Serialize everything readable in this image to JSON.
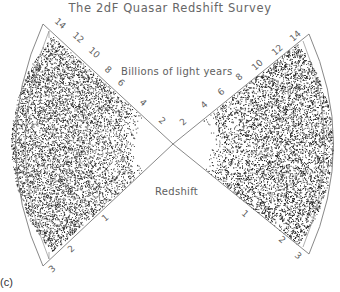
{
  "figure": {
    "title": "The 2dF Quasar Redshift Survey",
    "panel_label": "(c)",
    "upper_axis_label": "Billions of light years",
    "lower_axis_label": "Redshift",
    "colors": {
      "background": "#ffffff",
      "points": "#1a1a1a",
      "lines": "#777777",
      "text": "#606060"
    }
  },
  "chart_data": {
    "type": "scatter",
    "title": "The 2dF Quasar Redshift Survey",
    "upper_axis": {
      "label": "Billions of light years",
      "ticks": [
        2,
        4,
        6,
        8,
        10,
        12,
        14
      ]
    },
    "lower_axis": {
      "label": "Redshift",
      "ticks": [
        1,
        2,
        3
      ]
    },
    "wedges": [
      {
        "name": "left wedge",
        "radial_range_redshift": [
          0.3,
          3.0
        ],
        "density": "dense, increasing toward z~1.5-2"
      },
      {
        "name": "right wedge",
        "radial_range_redshift": [
          0.3,
          3.0
        ],
        "density": "dense, increasing toward z~1.5-2"
      }
    ],
    "grid": false,
    "legend": null
  }
}
